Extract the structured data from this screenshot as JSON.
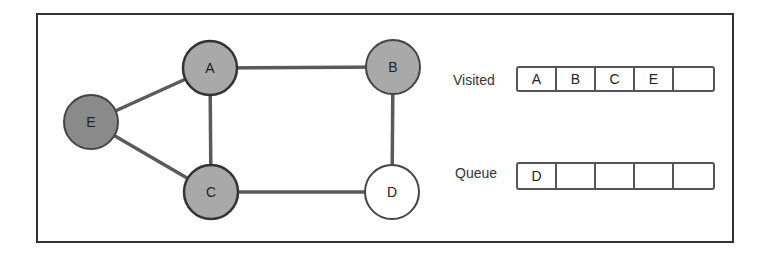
{
  "diagram": {
    "type": "bfs-graph-traversal",
    "nodes": [
      {
        "id": "A",
        "label": "A",
        "x": 210,
        "y": 68,
        "state": "visited",
        "fill": "#a8a8a8"
      },
      {
        "id": "B",
        "label": "B",
        "x": 393,
        "y": 67,
        "state": "visited",
        "fill": "#a8a8a8"
      },
      {
        "id": "C",
        "label": "C",
        "x": 211,
        "y": 192,
        "state": "visited",
        "fill": "#a8a8a8"
      },
      {
        "id": "D",
        "label": "D",
        "x": 392,
        "y": 192,
        "state": "queued",
        "fill": "#ffffff"
      },
      {
        "id": "E",
        "label": "E",
        "x": 91,
        "y": 122,
        "state": "visited",
        "fill": "#888888"
      }
    ],
    "edges": [
      [
        "E",
        "A"
      ],
      [
        "E",
        "C"
      ],
      [
        "A",
        "B"
      ],
      [
        "A",
        "C"
      ],
      [
        "B",
        "D"
      ],
      [
        "C",
        "D"
      ]
    ],
    "colors": {
      "edge": "#555555",
      "outline": "#333333",
      "frame": "#333333"
    }
  },
  "visited": {
    "label": "Visited",
    "cells": [
      "A",
      "B",
      "C",
      "E",
      ""
    ]
  },
  "queue": {
    "label": "Queue",
    "cells": [
      "D",
      "",
      "",
      "",
      ""
    ]
  }
}
